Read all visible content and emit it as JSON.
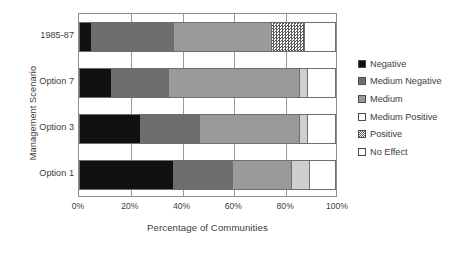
{
  "chart_data": {
    "type": "bar",
    "orientation": "horizontal",
    "stacked": true,
    "stack_mode": "percent",
    "title": "",
    "xlabel": "Percentage of Communities",
    "ylabel": "Management Scenario",
    "xlim": [
      0,
      100
    ],
    "xticks": [
      "0%",
      "20%",
      "40%",
      "60%",
      "80%",
      "100%"
    ],
    "xtick_values": [
      0,
      20,
      40,
      60,
      80,
      100
    ],
    "grid": true,
    "legend_position": "right",
    "categories": [
      "1985-87",
      "Option 7",
      "Option 3",
      "Option 1"
    ],
    "series": [
      {
        "name": "Negative",
        "color": "#101010",
        "pattern": "solid",
        "values": [
          5,
          13,
          24,
          37
        ]
      },
      {
        "name": "Medium Negative",
        "color": "#6e6e6e",
        "pattern": "solid",
        "values": [
          32,
          22,
          23,
          23
        ]
      },
      {
        "name": "Medium",
        "color": "#9a9a9a",
        "pattern": "solid",
        "values": [
          38,
          51,
          39,
          23
        ]
      },
      {
        "name": "Medium Positive",
        "color": "#cfcfcf",
        "pattern": "solid",
        "values": [
          0,
          3,
          3,
          7
        ]
      },
      {
        "name": "Positive",
        "color": "#f2f2f2",
        "pattern": "dotted",
        "values": [
          13,
          0,
          0,
          0
        ]
      },
      {
        "name": "No Effect",
        "color": "#ffffff",
        "pattern": "solid",
        "values": [
          12,
          11,
          11,
          10
        ]
      }
    ],
    "rows": [
      {
        "category": "1985-87",
        "segments": [
          5,
          32,
          38,
          0,
          13,
          12
        ]
      },
      {
        "category": "Option 7",
        "segments": [
          13,
          22,
          51,
          3,
          0,
          11
        ]
      },
      {
        "category": "Option 3",
        "segments": [
          24,
          23,
          39,
          3,
          0,
          11
        ]
      },
      {
        "category": "Option 1",
        "segments": [
          37,
          23,
          23,
          7,
          0,
          10
        ]
      }
    ]
  },
  "legend": {
    "items": [
      {
        "label": "Negative",
        "color": "#101010",
        "pattern": "solid"
      },
      {
        "label": "Medium Negative",
        "color": "#6e6e6e",
        "pattern": "solid"
      },
      {
        "label": "Medium",
        "color": "#9a9a9a",
        "pattern": "solid"
      },
      {
        "label": "Medium Positive",
        "color": "#ffffff",
        "pattern": "solid"
      },
      {
        "label": "Positive",
        "color": "#f2f2f2",
        "pattern": "dotted"
      },
      {
        "label": "No Effect",
        "color": "#ffffff",
        "pattern": "solid"
      }
    ]
  }
}
